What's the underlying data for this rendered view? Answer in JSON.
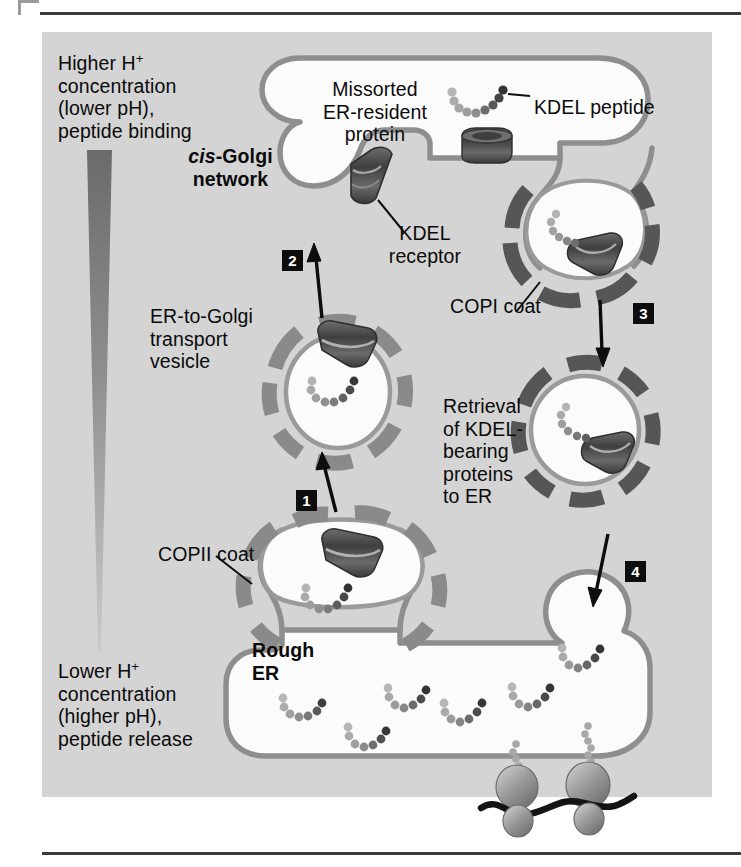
{
  "figure": {
    "background_color": "#d4d4d4",
    "page_color": "#ffffff",
    "panel": {
      "x": 42,
      "y": 32,
      "width": 670,
      "height": 765
    }
  },
  "labels": {
    "higher_h_line1": "Higher H",
    "higher_h_sup": "+",
    "higher_h_rest": "concentration\n(lower pH),\npeptide binding",
    "lower_h_line1": "Lower H",
    "lower_h_sup": "+",
    "lower_h_rest": "concentration\n(higher pH),\npeptide release",
    "cis_golgi_italic": "cis",
    "cis_golgi_rest": "-Golgi\nnetwork",
    "missorted_protein": "Missorted\nER-resident\nprotein",
    "kdel_peptide": "KDEL peptide",
    "kdel_receptor": "KDEL\nreceptor",
    "copi_coat": "COPI coat",
    "copii_coat": "COPII coat",
    "er_to_golgi_vesicle": "ER-to-Golgi\ntransport\nvesicle",
    "retrieval": "Retrieval\nof KDEL-\nbearing\nproteins\nto ER",
    "rough_er": "Rough\nER"
  },
  "steps": [
    {
      "number": "1",
      "x": 296,
      "y": 490
    },
    {
      "number": "2",
      "x": 282,
      "y": 250
    },
    {
      "number": "3",
      "x": 633,
      "y": 303
    },
    {
      "number": "4",
      "x": 625,
      "y": 561
    }
  ],
  "colors": {
    "panel_gray": "#d4d4d4",
    "membrane_gray": "#8e8e8e",
    "copi_coat_dark": "#5a5a5a",
    "copii_coat_mid": "#8a8a8a",
    "lumen_white": "#fbfbfb",
    "receptor_dark": "#4c4c4c",
    "peptide_light": "#b0b0b0",
    "peptide_dark_tip": "#3c3c3c",
    "ribosome_gray": "#9c9c9c",
    "mrna_black": "#141414",
    "step_box_black": "#0d0d0d",
    "text_black": "#0a0a0a",
    "gradient_top": "#6e6e6e",
    "gradient_bottom": "#c9c9c9"
  },
  "gradient_wedge": {
    "name": "pH-gradient-wedge",
    "top_label": "Higher H+ concentration (lower pH), peptide binding",
    "bottom_label": "Lower H+ concentration (higher pH), peptide release"
  },
  "diagram": {
    "type": "cell-biology-pathway",
    "organelles": [
      "cis-Golgi network",
      "Rough ER"
    ],
    "vesicles": [
      {
        "name": "ER-to-Golgi transport vesicle",
        "coat": "COPII"
      },
      {
        "name": "Golgi-budding retrieval vesicle",
        "coat": "COPI"
      },
      {
        "name": "Retrieval vesicle to ER",
        "coat": "COPI"
      },
      {
        "name": "ER-budding vesicle",
        "coat": "COPII"
      }
    ],
    "step_descriptions": [
      "1 — COPII vesicle buds from rough ER carrying missorted KDEL protein",
      "2 — Vesicle fuses with cis-Golgi network, KDEL peptide binds receptor at low pH",
      "3 — COPI-coated vesicle buds from Golgi with bound KDEL receptor",
      "4 — Retrieval vesicle returns to ER, higher pH releases peptide"
    ]
  }
}
